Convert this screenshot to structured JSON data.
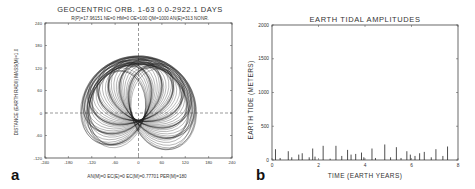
{
  "chart_data": [
    {
      "panel_label": "a",
      "type": "line",
      "title": "GEOCENTRIC  ORB. 1-63   0.0-2922.1  DAYS",
      "subtitle": "R(P)=17.96151  NE=0  HM=0  OE=100  QM=1000  AN(E)=313  NONR.",
      "xlabel": "",
      "ylabel": "DISTANCE (EARTH RADII)   MASS(M)=1.0",
      "xlim": [
        -240,
        240
      ],
      "ylim": [
        -120,
        240
      ],
      "xticks": [
        "-240",
        "-180",
        "-120",
        "-60",
        "0",
        "60",
        "120",
        "180",
        "240"
      ],
      "yticks": [
        "240",
        "180",
        "120",
        "60",
        "0",
        "-60",
        "-120"
      ],
      "grid": false,
      "crosshair": "dashed lines at x=0 and y=0",
      "caption": "AN(M)=0  EC(E)=0  EC(M)=0.77701  PER(M)=180",
      "description": "Overlapping elliptical orbit traces (orbits 1-63) forming a dome shape centered near origin, spanning approx x -160..160 and y -50..160"
    },
    {
      "panel_label": "b",
      "type": "bar",
      "title": "EARTH TIDAL AMPLITUDES",
      "xlabel": "TIME (EARTH YEARS)",
      "ylabel": "EARTH TIDE (METERS)",
      "xlim": [
        0,
        8
      ],
      "ylim": [
        0,
        2000
      ],
      "xticks": [
        "0",
        "2",
        "4",
        "6",
        "8"
      ],
      "yticks": [
        "0",
        "500",
        "1000",
        "1500",
        "2000"
      ],
      "grid": false,
      "series": [
        {
          "name": "tidal amplitude",
          "x": [
            0.15,
            0.35,
            0.7,
            0.85,
            1.15,
            1.3,
            1.6,
            1.75,
            1.85,
            2.2,
            2.5,
            2.75,
            3.0,
            3.25,
            3.4,
            3.6,
            3.85,
            3.95,
            4.3,
            4.45,
            4.85,
            5.1,
            5.35,
            5.55,
            5.8,
            5.95,
            6.15,
            6.35,
            6.55,
            6.85,
            7.05,
            7.35,
            7.55
          ],
          "values": [
            160,
            30,
            130,
            40,
            80,
            100,
            40,
            170,
            50,
            210,
            20,
            210,
            60,
            150,
            80,
            90,
            110,
            40,
            170,
            30,
            230,
            40,
            190,
            30,
            130,
            80,
            60,
            100,
            120,
            40,
            160,
            60,
            200
          ]
        }
      ]
    }
  ]
}
